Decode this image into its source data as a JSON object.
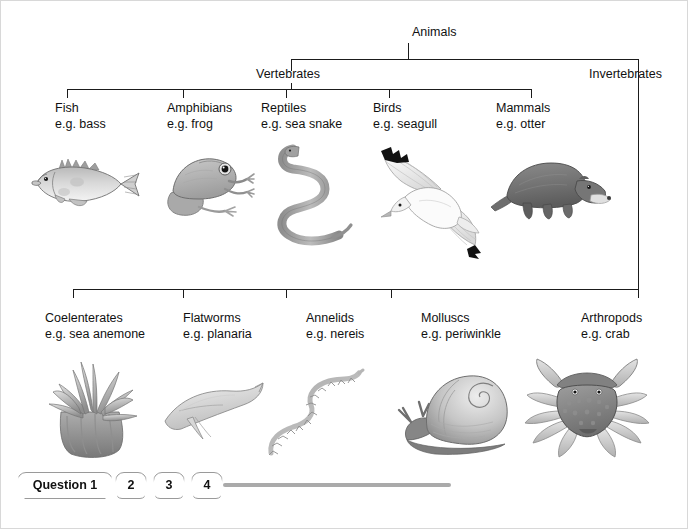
{
  "diagram": {
    "root": {
      "label": "Animals"
    },
    "branches": [
      {
        "label": "Vertebrates"
      },
      {
        "label": "Invertebrates"
      }
    ],
    "vertebrates": [
      {
        "name": "Fish",
        "eg": "e.g. bass",
        "figure": "fish-illustration"
      },
      {
        "name": "Amphibians",
        "eg": "e.g. frog",
        "figure": "frog-illustration"
      },
      {
        "name": "Reptiles",
        "eg": "e.g. sea snake",
        "figure": "sea-snake-illustration"
      },
      {
        "name": "Birds",
        "eg": "e.g. seagull",
        "figure": "seagull-illustration"
      },
      {
        "name": "Mammals",
        "eg": "e.g. otter",
        "figure": "otter-illustration"
      }
    ],
    "invertebrates": [
      {
        "name": "Coelenterates",
        "eg": "e.g. sea anemone",
        "figure": "sea-anemone-illustration"
      },
      {
        "name": "Flatworms",
        "eg": "e.g. planaria",
        "figure": "planaria-illustration"
      },
      {
        "name": "Annelids",
        "eg": "e.g. nereis",
        "figure": "nereis-illustration"
      },
      {
        "name": "Molluscs",
        "eg": "e.g. periwinkle",
        "figure": "periwinkle-illustration"
      },
      {
        "name": "Arthropods",
        "eg": "e.g. crab",
        "figure": "crab-illustration"
      }
    ]
  },
  "tabbar": {
    "tabs": [
      {
        "label": "Question 1",
        "selected": true
      },
      {
        "label": "2",
        "selected": false
      },
      {
        "label": "3",
        "selected": false
      },
      {
        "label": "4",
        "selected": false
      }
    ]
  },
  "colors": {
    "line": "#1b1b1b",
    "text": "#111111",
    "tab_border": "#9a9a9a",
    "progress_rule": "#aaaaaa",
    "background": "#ffffff"
  }
}
